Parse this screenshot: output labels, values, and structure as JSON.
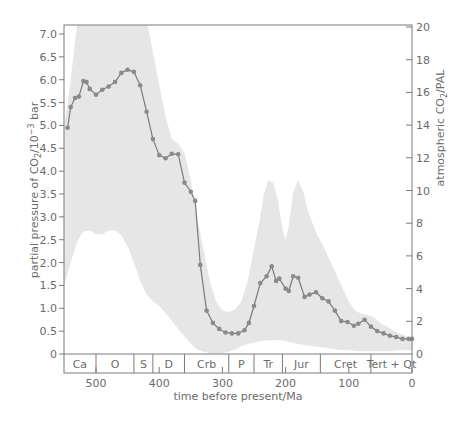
{
  "chart_data": {
    "type": "line",
    "title": "",
    "xlabel": "time before present/Ma",
    "ylabel_left": "partial pressure of CO2/10^-3 bar",
    "ylabel_right": "atmospheric CO2/PAL",
    "xlim": [
      551,
      0
    ],
    "ylim_left": [
      0,
      7.2
    ],
    "ylim_right": [
      0,
      20.5
    ],
    "x_ticks": [
      500,
      400,
      300,
      200,
      100,
      0
    ],
    "y_ticks_left": [
      "0",
      "0.5",
      "1.0",
      "1.5",
      "2.0",
      "2.5",
      "3.0",
      "3.5",
      "4.0",
      "4.5",
      "5.0",
      "5.5",
      "6.0",
      "6.5",
      "7.0"
    ],
    "y_ticks_right": [
      "0",
      "2",
      "4",
      "6",
      "8",
      "10",
      "12",
      "14",
      "16",
      "18",
      "20"
    ],
    "grid": false,
    "legend": null,
    "series": [
      {
        "name": "CO2 partial pressure (best estimate)",
        "x": [
          545,
          540,
          533,
          527,
          520,
          515,
          510,
          500,
          490,
          480,
          470,
          460,
          450,
          440,
          430,
          420,
          410,
          400,
          390,
          380,
          370,
          360,
          350,
          343,
          335,
          325,
          315,
          305,
          295,
          285,
          275,
          265,
          258,
          250,
          240,
          230,
          222,
          215,
          210,
          200,
          195,
          188,
          180,
          170,
          162,
          152,
          142,
          132,
          122,
          112,
          102,
          92,
          85,
          75,
          65,
          55,
          45,
          35,
          25,
          15,
          5,
          0
        ],
        "y": [
          4.95,
          5.4,
          5.6,
          5.63,
          5.97,
          5.95,
          5.8,
          5.67,
          5.78,
          5.85,
          5.95,
          6.15,
          6.22,
          6.17,
          5.88,
          5.3,
          4.7,
          4.35,
          4.28,
          4.38,
          4.37,
          3.75,
          3.55,
          3.35,
          1.95,
          0.95,
          0.68,
          0.55,
          0.47,
          0.45,
          0.45,
          0.52,
          0.68,
          1.05,
          1.55,
          1.7,
          1.92,
          1.6,
          1.65,
          1.43,
          1.38,
          1.7,
          1.67,
          1.25,
          1.3,
          1.35,
          1.22,
          1.15,
          0.95,
          0.72,
          0.7,
          0.62,
          0.66,
          0.75,
          0.6,
          0.5,
          0.45,
          0.4,
          0.37,
          0.33,
          0.33,
          0.33
        ]
      },
      {
        "name": "uncertainty band upper",
        "x": [
          551,
          540,
          530,
          520,
          510,
          500,
          490,
          480,
          470,
          460,
          450,
          440,
          430,
          420,
          410,
          400,
          390,
          380,
          370,
          360,
          350,
          340,
          330,
          320,
          310,
          300,
          290,
          280,
          270,
          260,
          250,
          240,
          235,
          228,
          220,
          212,
          205,
          200,
          195,
          188,
          180,
          172,
          165,
          160,
          150,
          140,
          130,
          120,
          110,
          100,
          90,
          80,
          70,
          60,
          50,
          40,
          30,
          20,
          10,
          0
        ],
        "y": [
          4.9,
          6.0,
          7.2,
          7.5,
          7.5,
          7.5,
          7.5,
          7.5,
          7.5,
          7.5,
          7.5,
          7.5,
          7.5,
          7.3,
          6.6,
          5.9,
          5.2,
          4.7,
          4.6,
          4.4,
          3.8,
          3.0,
          2.3,
          1.6,
          1.15,
          0.95,
          0.92,
          0.97,
          1.15,
          1.6,
          2.3,
          3.0,
          3.45,
          3.8,
          3.75,
          3.35,
          2.75,
          2.48,
          2.8,
          3.55,
          3.8,
          3.55,
          3.15,
          2.95,
          2.6,
          2.35,
          2.05,
          1.75,
          1.45,
          1.15,
          0.95,
          0.88,
          0.85,
          0.8,
          0.68,
          0.6,
          0.52,
          0.45,
          0.4,
          0.33
        ]
      },
      {
        "name": "uncertainty band lower",
        "x": [
          551,
          540,
          530,
          520,
          510,
          500,
          490,
          480,
          470,
          460,
          450,
          440,
          430,
          420,
          410,
          400,
          390,
          380,
          370,
          360,
          350,
          340,
          330,
          320,
          310,
          300,
          290,
          280,
          270,
          260,
          250,
          240,
          230,
          220,
          210,
          200,
          190,
          180,
          170,
          160,
          150,
          140,
          130,
          120,
          110,
          100,
          90,
          80,
          70,
          60,
          50,
          40,
          30,
          20,
          10,
          0
        ],
        "y": [
          1.45,
          2.0,
          2.45,
          2.68,
          2.7,
          2.62,
          2.62,
          2.7,
          2.7,
          2.6,
          2.35,
          2.0,
          1.6,
          1.3,
          1.15,
          1.05,
          0.9,
          0.72,
          0.55,
          0.38,
          0.22,
          0.1,
          0.05,
          0.02,
          0.01,
          0.02,
          0.05,
          0.1,
          0.17,
          0.22,
          0.25,
          0.28,
          0.3,
          0.3,
          0.3,
          0.28,
          0.25,
          0.22,
          0.2,
          0.18,
          0.16,
          0.14,
          0.12,
          0.1,
          0.09,
          0.08,
          0.07,
          0.06,
          0.06,
          0.06,
          0.06,
          0.06,
          0.07,
          0.08,
          0.08,
          0.08
        ]
      }
    ],
    "annotations": [
      {
        "label": "Ca",
        "from": 551,
        "to": 500
      },
      {
        "label": "O",
        "from": 500,
        "to": 440
      },
      {
        "label": "S",
        "from": 440,
        "to": 410
      },
      {
        "label": "D",
        "from": 410,
        "to": 360
      },
      {
        "label": "Crb",
        "from": 360,
        "to": 290
      },
      {
        "label": "P",
        "from": 290,
        "to": 250
      },
      {
        "label": "Tr",
        "from": 250,
        "to": 205
      },
      {
        "label": "Jur",
        "from": 205,
        "to": 145
      },
      {
        "label": "Cret",
        "from": 145,
        "to": 65
      },
      {
        "label": "Tert + Qt",
        "from": 65,
        "to": 0
      }
    ]
  },
  "labels": {
    "x_axis_title": "time before present/Ma",
    "left_axis_title_pre": "partial pressure of CO",
    "left_axis_title_sub": "2",
    "left_axis_title_mid": "/10",
    "left_axis_title_sup": "−3",
    "left_axis_title_post": " bar",
    "right_axis_title_pre": "atmospheric CO",
    "right_axis_title_sub": "2",
    "right_axis_title_post": "/PAL"
  },
  "colors": {
    "band": "#e6e6e6",
    "line": "#7a7a7a",
    "marker": "#8a8a8a",
    "axis": "#7a7a7a",
    "text": "#6b6b6b"
  }
}
